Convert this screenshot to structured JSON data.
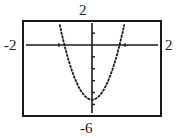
{
  "chart_data": {
    "type": "line",
    "title": "",
    "xlabel": "",
    "ylabel": "",
    "xlim": [
      -2,
      2
    ],
    "ylim": [
      -6,
      2
    ],
    "window_labels": {
      "top": "2",
      "bottom": "-6",
      "left": "-2",
      "right": "2"
    },
    "grid": false,
    "legend": null,
    "x_ticks": [
      -1,
      1
    ],
    "y_ticks": [
      -5,
      -4,
      -3,
      -2,
      -1,
      1
    ],
    "series": [
      {
        "name": "parabola",
        "description": "upward-opening parabola symmetric about the y-axis, vertex near (0, -4.6), x-intercepts near ±0.8, reaches top of window (y=2) near x=±1",
        "x": [
          -1.0,
          -0.8,
          -0.6,
          -0.4,
          -0.2,
          0.0,
          0.2,
          0.4,
          0.6,
          0.8,
          1.0
        ],
        "y": [
          2.0,
          0.0,
          -1.9,
          -3.4,
          -4.3,
          -4.6,
          -4.3,
          -3.4,
          -1.9,
          0.0,
          2.0
        ]
      }
    ]
  },
  "colors": {
    "ink": "#1a1a1a",
    "background": "#ffffff"
  }
}
